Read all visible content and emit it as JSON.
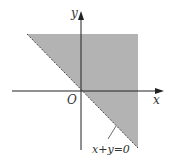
{
  "diagram": {
    "type": "coordinate-plane-region",
    "axes": {
      "x_label": "x",
      "y_label": "y",
      "origin_label": "O"
    },
    "boundary": {
      "equation": "x+y=0",
      "style": "dashed"
    },
    "region": {
      "description": "x+y>0 (shaded, upper-right of line)",
      "fill": "#b3b3b3"
    },
    "colors": {
      "axis": "#222222",
      "shade": "#b3b3b3",
      "text": "#333333"
    }
  }
}
